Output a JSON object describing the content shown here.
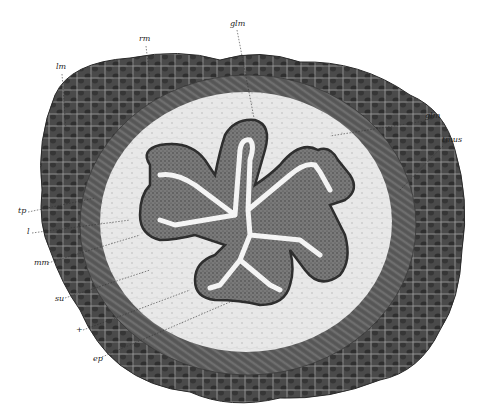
{
  "figure": {
    "palette": {
      "background": "#ffffff",
      "outer_muscle": "#4a4a4a",
      "muscle_highlight": "#8a8a8a",
      "circular_muscle": "#5c5c5c",
      "submucosa": "#e6e6e6",
      "epithelium_dark": "#3a3a3a",
      "lumen": "#f4f4f4",
      "label_text": "#222222",
      "leader_line": "#333333"
    },
    "labels": [
      {
        "id": "lm",
        "text": "lm",
        "x": 61,
        "y": 71
      },
      {
        "id": "rm",
        "text": "rm",
        "x": 143,
        "y": 42
      },
      {
        "id": "glm_top",
        "text": "glm",
        "x": 233,
        "y": 26
      },
      {
        "id": "glm_right",
        "text": "glm",
        "x": 427,
        "y": 119
      },
      {
        "id": "tmus",
        "text": "tmus",
        "x": 445,
        "y": 142
      },
      {
        "id": "tp",
        "text": "tp",
        "x": 18,
        "y": 211
      },
      {
        "id": "l",
        "text": "l",
        "x": 26,
        "y": 232
      },
      {
        "id": "mm",
        "text": "mm",
        "x": 35,
        "y": 261
      },
      {
        "id": "su",
        "text": "su",
        "x": 55,
        "y": 297
      },
      {
        "id": "plus",
        "text": "+",
        "x": 77,
        "y": 329
      },
      {
        "id": "ep",
        "text": "ep",
        "x": 92,
        "y": 356
      }
    ]
  }
}
